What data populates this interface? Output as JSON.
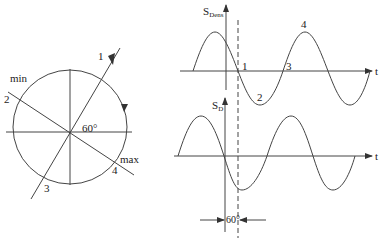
{
  "phasor_diagram": {
    "angle_label": "60°",
    "min_label": "min",
    "max_label": "max",
    "points": [
      "1",
      "2",
      "3",
      "4"
    ],
    "rotation_direction": "counter-clockwise"
  },
  "top_graph": {
    "y_label_main": "S",
    "y_label_sub": "Dens",
    "x_label": "t",
    "point_labels": [
      "1",
      "2",
      "3",
      "4"
    ]
  },
  "bottom_graph": {
    "y_label_main": "S",
    "y_label_sub": "D",
    "x_label": "t",
    "phase_shift_label": "60°"
  },
  "colors": {
    "stroke": "#333333",
    "background": "#ffffff"
  }
}
